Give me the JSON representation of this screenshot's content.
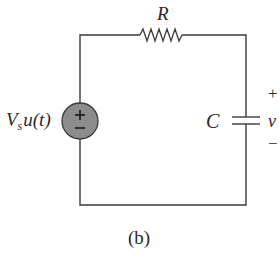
{
  "diagram": {
    "type": "RC circuit",
    "caption": "(b)",
    "labels": {
      "resistor": "R",
      "source_V": "V",
      "source_sub": "s",
      "source_rest": "u(t)",
      "capacitor": "C",
      "voltage": "v",
      "plus": "+",
      "minus": "−"
    },
    "source_symbols": {
      "plus": "+",
      "minus": "−"
    },
    "colors": {
      "wire": "#3a3a3a",
      "source_fill": "#8c8c8c",
      "source_stroke": "#3a3a3a",
      "text": "#2a2a2a",
      "background": "#ffffff"
    },
    "components": [
      {
        "id": "source",
        "kind": "independent voltage source (step)",
        "label": "Vs u(t)"
      },
      {
        "id": "resistor",
        "kind": "resistor",
        "label": "R"
      },
      {
        "id": "capacitor",
        "kind": "capacitor",
        "label": "C",
        "voltage": "v",
        "polarity": "+ top, − bottom"
      }
    ]
  }
}
